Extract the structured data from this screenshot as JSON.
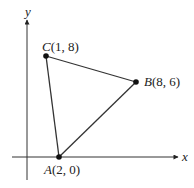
{
  "diagram": {
    "axes": {
      "x_label": "x",
      "y_label": "y"
    },
    "points": [
      {
        "name": "A",
        "coords": "(2, 0)",
        "x": 2,
        "y": 0
      },
      {
        "name": "B",
        "coords": "(8, 6)",
        "x": 8,
        "y": 6
      },
      {
        "name": "C",
        "coords": "(1, 8)",
        "x": 1,
        "y": 8
      }
    ],
    "shape": "triangle ABC",
    "colors": {
      "line": "#333333",
      "point": "#111111"
    }
  }
}
